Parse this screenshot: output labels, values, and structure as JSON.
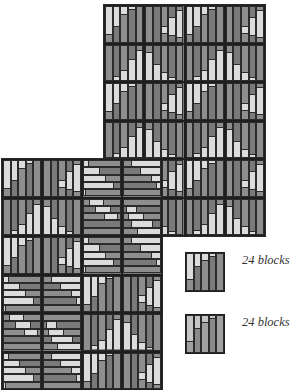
{
  "colors": {
    "light": "#dcdcdc",
    "mid": "#8e8e8e",
    "dark": "#7a7a7a",
    "line": "#2b2b2b",
    "alt_light": "#c6c6c6",
    "alt_mid": "#a0a0a0",
    "alt_dark": "#8a8a8a"
  },
  "block_types": {
    "A": {
      "orient": "v",
      "light": [
        [
          0,
          0.82
        ],
        [
          0,
          0.58
        ],
        [
          0,
          0.22
        ],
        [
          0,
          0.08
        ],
        [
          0,
          0
        ]
      ],
      "mid_after": [
        true,
        true,
        true,
        true,
        true
      ]
    },
    "B": {
      "orient": "v",
      "light": [
        [
          1,
          1
        ],
        [
          0.88,
          1
        ],
        [
          0.72,
          1
        ],
        [
          0.4,
          1
        ],
        [
          0.12,
          1
        ]
      ]
    },
    "C": {
      "orient": "v",
      "light": [
        [
          0,
          0
        ],
        [
          0,
          0
        ],
        [
          0.55,
          0.78
        ],
        [
          0.3,
          0.85
        ],
        [
          0.1,
          0.9
        ]
      ]
    },
    "D": {
      "orient": "v",
      "light": [
        [
          0.2,
          1
        ],
        [
          0.55,
          1
        ],
        [
          0.78,
          1
        ],
        [
          0.92,
          1
        ],
        [
          1,
          1
        ]
      ]
    },
    "H1": {
      "orient": "h",
      "light": [
        [
          0,
          0.15
        ],
        [
          0,
          0.45
        ],
        [
          0,
          0.62
        ],
        [
          0,
          0.82
        ],
        [
          0,
          0.05
        ]
      ]
    },
    "H2": {
      "orient": "h",
      "light": [
        [
          0.2,
          1
        ],
        [
          0.45,
          1
        ],
        [
          0.75,
          1
        ],
        [
          0.9,
          1
        ],
        [
          1,
          1
        ]
      ]
    },
    "H3": {
      "orient": "h",
      "light": [
        [
          0.15,
          0.55
        ],
        [
          0.3,
          0.75
        ],
        [
          0.55,
          0.95
        ],
        [
          0,
          0
        ],
        [
          0,
          0
        ]
      ]
    },
    "H4": {
      "orient": "h",
      "light": [
        [
          0,
          0
        ],
        [
          0.05,
          0.35
        ],
        [
          0.1,
          0.55
        ],
        [
          0.2,
          0.8
        ],
        [
          0.35,
          1
        ]
      ]
    }
  },
  "panels": [
    {
      "name": "top-panel",
      "x": 104,
      "y": 5,
      "block_w": 40.25,
      "block_h": 38.5,
      "rows": [
        [
          "A",
          "C",
          "A",
          "C"
        ],
        [
          "B",
          "D",
          "B",
          "D"
        ],
        [
          "A",
          "C",
          "A",
          "C"
        ],
        [
          "B",
          "D",
          "B",
          "D"
        ],
        [
          "A",
          "C",
          "A",
          "C"
        ],
        [
          "B",
          "D",
          "B",
          "D"
        ]
      ]
    },
    {
      "name": "bottom-panel",
      "x": 2,
      "y": 159,
      "block_w": 40,
      "block_h": 38.5,
      "rows": [
        [
          "A",
          "C",
          "H1",
          "H2"
        ],
        [
          "B",
          "D",
          "H3",
          "H4"
        ],
        [
          "A",
          "C",
          "H1",
          "H2"
        ],
        [
          "H1",
          "H2",
          "A",
          "C"
        ],
        [
          "H3",
          "H4",
          "B",
          "D"
        ],
        [
          "H1",
          "H2",
          "A",
          "C"
        ]
      ]
    }
  ],
  "legend": [
    {
      "block": {
        "orient": "v",
        "light": [
          [
            0,
            0.72
          ],
          [
            0,
            0.35
          ],
          [
            0,
            0.2
          ],
          [
            0,
            0.08
          ],
          [
            0,
            0
          ]
        ]
      },
      "x": 185,
      "y": 252,
      "w": 40,
      "h": 40,
      "label": "24 blocks",
      "label_x": 242,
      "label_y": 253,
      "alt": false
    },
    {
      "block": {
        "orient": "v",
        "light": [
          [
            0,
            0.72
          ],
          [
            0,
            0.35
          ],
          [
            0,
            0.2
          ],
          [
            0,
            0.08
          ],
          [
            0,
            0
          ]
        ]
      },
      "x": 185,
      "y": 314,
      "w": 40,
      "h": 40,
      "label": "24 blocks",
      "label_x": 242,
      "label_y": 315,
      "alt": true
    }
  ]
}
